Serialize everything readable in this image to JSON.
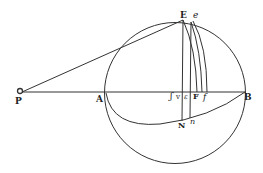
{
  "figure": {
    "type": "geometric-diagram",
    "stroke_color": "#333333",
    "background": "#ffffff",
    "labels": {
      "P": "P",
      "A": "A",
      "B": "B",
      "E": "E",
      "e": "e",
      "s": "ʃ",
      "v": "v",
      "epsilon": "ε",
      "F": "F",
      "f": "f",
      "N": "N",
      "n": "n"
    },
    "points": {
      "P": [
        20,
        92
      ],
      "A": [
        105,
        92
      ],
      "B": [
        245,
        92
      ],
      "E": [
        183,
        20
      ],
      "e": [
        191,
        21
      ],
      "N": [
        182,
        120
      ],
      "n": [
        191,
        117
      ]
    },
    "circle": {
      "cx": 175,
      "cy": 96,
      "r": 70
    }
  }
}
